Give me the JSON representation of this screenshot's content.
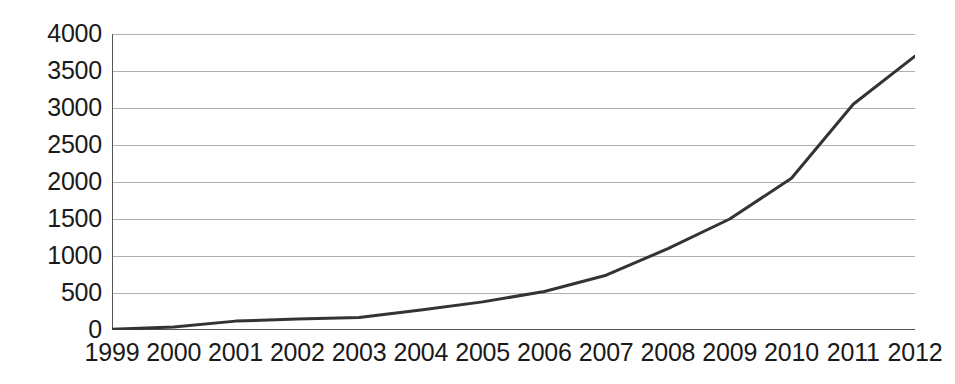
{
  "chart_data": {
    "type": "line",
    "title": "",
    "subtitle": "",
    "xlabel": "",
    "ylabel": "",
    "categories": [
      "1999",
      "2000",
      "2001",
      "2002",
      "2003",
      "2004",
      "2005",
      "2006",
      "2007",
      "2008",
      "2009",
      "2010",
      "2011",
      "2012"
    ],
    "values": [
      10,
      40,
      120,
      150,
      170,
      270,
      380,
      520,
      740,
      1100,
      1500,
      2050,
      3050,
      3700
    ],
    "series": [
      {
        "name": "",
        "values": [
          10,
          40,
          120,
          150,
          170,
          270,
          380,
          520,
          740,
          1100,
          1500,
          2050,
          3050,
          3700
        ]
      }
    ],
    "x_tick_labels": [
      "1999",
      "2000",
      "2001",
      "2002",
      "2003",
      "2004",
      "2005",
      "2006",
      "2007",
      "2008",
      "2009",
      "2010",
      "2011",
      "2012"
    ],
    "y_tick_labels": [
      "0",
      "500",
      "1000",
      "1500",
      "2000",
      "2500",
      "3000",
      "3500",
      "4000"
    ],
    "y_tick_values": [
      0,
      500,
      1000,
      1500,
      2000,
      2500,
      3000,
      3500,
      4000
    ],
    "ylim": [
      0,
      4000
    ],
    "grid": true,
    "grid_axis": "y",
    "legend": false,
    "legend_position": "none",
    "annotations": [],
    "colors": {
      "line": "#333333",
      "grid": "#b0b0b0",
      "axis": "#555555",
      "text": "#1a1a1a",
      "background": "#ffffff"
    }
  }
}
